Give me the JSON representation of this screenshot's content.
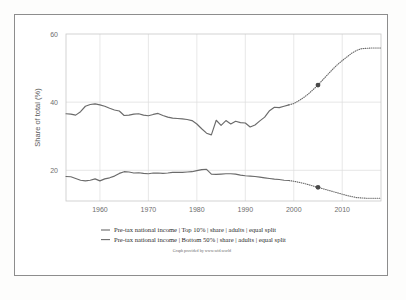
{
  "chart_data": {
    "type": "line",
    "title": "",
    "subtitle": "",
    "xlabel": "",
    "ylabel": "Share of total (%)",
    "xlim": [
      1953,
      2018
    ],
    "ylim": [
      11,
      60
    ],
    "grid": true,
    "legend_position": "bottom",
    "credit": "Graph provided by www.wid.world",
    "xticks": [
      1960,
      1970,
      1980,
      1990,
      2000,
      2010
    ],
    "xtick_labels": [
      "1960",
      "1970",
      "1980",
      "1990",
      "2000",
      "2010"
    ],
    "yticks": [
      20,
      40,
      60
    ],
    "ytick_labels": [
      "20",
      "40",
      "60"
    ],
    "series": [
      {
        "name": "Pre-tax national income | Top 10% | share | adults | equal split",
        "color": "#6b6b6b",
        "style": "solid-with-dotted-segments",
        "marker_points": [
          {
            "x": 2005,
            "y": 45.0
          }
        ],
        "x": [
          1953,
          1954,
          1955,
          1956,
          1957,
          1958,
          1959,
          1960,
          1961,
          1962,
          1963,
          1964,
          1965,
          1966,
          1967,
          1968,
          1969,
          1970,
          1971,
          1972,
          1973,
          1974,
          1975,
          1976,
          1977,
          1978,
          1979,
          1980,
          1981,
          1982,
          1983,
          1984,
          1985,
          1986,
          1987,
          1988,
          1989,
          1990,
          1991,
          1992,
          1993,
          1994,
          1995,
          1996,
          1997,
          1998,
          1999,
          2000,
          2001,
          2002,
          2003,
          2004,
          2005,
          2006,
          2007,
          2008,
          2009,
          2010,
          2011,
          2012,
          2013,
          2014,
          2015,
          2016,
          2017,
          2018
        ],
        "y": [
          36.6,
          36.5,
          36.2,
          37.2,
          38.8,
          39.3,
          39.5,
          39.2,
          38.8,
          38.2,
          37.7,
          37.4,
          36.1,
          36.2,
          36.5,
          36.6,
          36.2,
          36.0,
          36.4,
          36.7,
          36.1,
          35.6,
          35.3,
          35.2,
          35.1,
          34.9,
          34.6,
          33.6,
          32.2,
          30.9,
          30.4,
          34.7,
          33.2,
          34.6,
          33.6,
          34.4,
          34.0,
          33.9,
          32.7,
          33.3,
          34.5,
          35.6,
          37.5,
          38.5,
          38.4,
          38.8,
          39.2,
          39.6,
          40.4,
          41.3,
          42.4,
          43.7,
          45.0,
          46.6,
          48.1,
          49.6,
          51.0,
          52.2,
          53.3,
          54.4,
          55.2,
          55.7,
          55.8,
          55.9,
          55.9,
          55.9
        ],
        "dotted_from_year": 1999
      },
      {
        "name": "Pre-tax national income | Bottom 50% | share | adults | equal split",
        "color": "#6b6b6b",
        "style": "solid-with-dotted-segments",
        "marker_points": [
          {
            "x": 2005,
            "y": 15.0
          }
        ],
        "x": [
          1953,
          1954,
          1955,
          1956,
          1957,
          1958,
          1959,
          1960,
          1961,
          1962,
          1963,
          1964,
          1965,
          1966,
          1967,
          1968,
          1969,
          1970,
          1971,
          1972,
          1973,
          1974,
          1975,
          1976,
          1977,
          1978,
          1979,
          1980,
          1981,
          1982,
          1983,
          1984,
          1985,
          1986,
          1987,
          1988,
          1989,
          1990,
          1991,
          1992,
          1993,
          1994,
          1995,
          1996,
          1997,
          1998,
          1999,
          2000,
          2001,
          2002,
          2003,
          2004,
          2005,
          2006,
          2007,
          2008,
          2009,
          2010,
          2011,
          2012,
          2013,
          2014,
          2015,
          2016,
          2017,
          2018
        ],
        "y": [
          18.2,
          18.1,
          17.6,
          17.1,
          16.9,
          17.1,
          17.5,
          16.9,
          17.5,
          17.8,
          18.3,
          19.1,
          19.6,
          19.5,
          19.2,
          19.3,
          19.1,
          19.0,
          19.2,
          19.2,
          19.1,
          19.2,
          19.4,
          19.4,
          19.4,
          19.5,
          19.6,
          19.9,
          20.2,
          20.3,
          18.9,
          18.8,
          18.9,
          19.0,
          19.0,
          18.9,
          18.6,
          18.4,
          18.3,
          18.2,
          18.0,
          17.8,
          17.6,
          17.4,
          17.3,
          17.1,
          17.0,
          16.8,
          16.5,
          16.2,
          15.8,
          15.4,
          15.0,
          14.6,
          14.2,
          13.8,
          13.4,
          13.0,
          12.6,
          12.3,
          12.0,
          11.9,
          11.8,
          11.8,
          11.8,
          11.8
        ],
        "dotted_from_year": 1999
      }
    ]
  },
  "axes": {
    "y_title": "Share of total (%)"
  },
  "legend": {
    "items": [
      {
        "label": "Pre-tax national income | Top 10% | share | adults | equal split"
      },
      {
        "label": "Pre-tax national income | Bottom 50% | share | adults | equal split"
      }
    ]
  },
  "footer": {
    "credit": "Graph provided by www.wid.world"
  }
}
